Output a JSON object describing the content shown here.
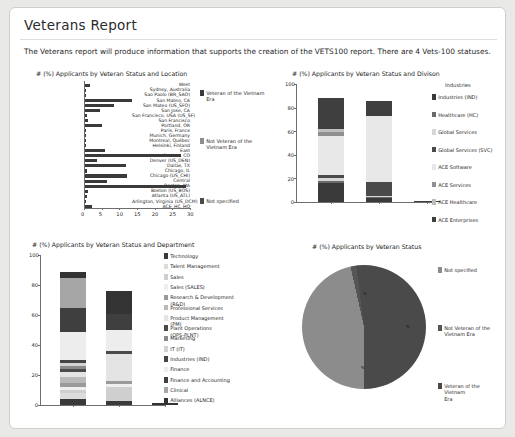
{
  "page": {
    "title": "Veterans Report",
    "intro": "The Veterans report will produce information that supports the creation of the VETS100 report. There are 4 Vets-100 statuses."
  },
  "colors": {
    "dark": "#3a3a3a",
    "mid": "#6f6f6f",
    "light": "#c9c9c9",
    "lighter": "#e2e2e2",
    "panel_bg": "#ffffff",
    "page_bg": "#e9e9e7",
    "border": "#d0cfcb"
  },
  "veteran_status_legend": [
    {
      "label": "Veteran of the Vietnam\nEra",
      "color": "#3a3a3a"
    },
    {
      "label": "Not Veteran of the\nVietnam Era",
      "color": "#8c8c8c"
    },
    {
      "label": "Not specified",
      "color": "#4a4a4a"
    }
  ],
  "chart_data": [
    {
      "id": "location-bar",
      "type": "bar",
      "orientation": "horizontal",
      "title": "# (%) Applicants by Veteran Status and Location",
      "xlabel": "",
      "ylabel": "",
      "xlim": [
        0,
        30
      ],
      "xticks": [
        0,
        5,
        10,
        15,
        20,
        25,
        30
      ],
      "categories": [
        "West",
        "Sydney, Australia",
        "Sao Paolo (BR_SAO)",
        "San Mateo, CA",
        "San Mateo (US_SFO)",
        "San Jose, CA",
        "San Francisco, USA (US_SF)",
        "San Francisco",
        "Portland, OR",
        "Paris, France",
        "Munich, Germany",
        "Montreal, Québec",
        "Helsinki, Finland",
        "East",
        "Denver, CO",
        "Denver (US_DEN)",
        "Dallas, TX",
        "Chicago, IL",
        "Chicago (US_CHI)",
        "Central",
        "Boston, MA",
        "Boston (US_BOS)",
        "Atlanta (US_ATL)",
        "Arlington, Virginia (US_DCM)",
        "ACE_HC_HQ"
      ],
      "values": [
        1.8,
        0.7,
        0.7,
        13.6,
        8.5,
        4.5,
        0.9,
        1.2,
        5.1,
        0.6,
        0.6,
        0.6,
        0.6,
        5.9,
        27.4,
        3.7,
        11.9,
        0.8,
        12.1,
        6.6,
        28.9,
        1.0,
        0.9,
        0.6,
        2.2
      ],
      "legend": [
        "Veteran of the Vietnam Era",
        "Not Veteran of the Vietnam Era",
        "Not specified"
      ],
      "legend_position": "right"
    },
    {
      "id": "division-stack",
      "type": "bar",
      "stacked": true,
      "title": "# (%) Applicants by Veteran Status and Divison",
      "ylim": [
        0,
        100
      ],
      "yticks": [
        0,
        20,
        40,
        60,
        80,
        100
      ],
      "categories": [
        "Veteran of the Vietnam Era",
        "Not Veteran of the Vietnam Era",
        "Not specified"
      ],
      "series": [
        {
          "name": "Industries (IND)",
          "color": "#3a3a3a",
          "values": [
            16.0,
            3.0,
            0.0
          ]
        },
        {
          "name": "Healthcare (HC)",
          "color": "#6a6a6a",
          "values": [
            2.0,
            1.5,
            0.0
          ]
        },
        {
          "name": "Global Services",
          "color": "#d6d6d6",
          "values": [
            2.0,
            0.5,
            0.0
          ]
        },
        {
          "name": "Global Services (SVC)",
          "color": "#4a4a4a",
          "values": [
            3.0,
            12.0,
            0.0
          ]
        },
        {
          "name": "ACE Software",
          "color": "#e8e8e8",
          "values": [
            33.0,
            56.0,
            0.0
          ]
        },
        {
          "name": "ACE Services",
          "color": "#8f8f8f",
          "values": [
            3.0,
            0.0,
            0.0
          ]
        },
        {
          "name": "ACE Healthcare",
          "color": "#bdbdbd",
          "values": [
            3.0,
            0.0,
            0.0
          ]
        },
        {
          "name": "ACE Enterprises",
          "color": "#3f3f3f",
          "values": [
            26.0,
            13.0,
            1.2
          ]
        }
      ],
      "legend_title": "Industries",
      "legend_position": "right"
    },
    {
      "id": "department-stack",
      "type": "bar",
      "stacked": true,
      "title": "# (%) Applicants by Veteran Status and Department",
      "ylim": [
        0,
        100
      ],
      "yticks": [
        0,
        20,
        40,
        60,
        80,
        100
      ],
      "categories": [
        "Veteran of the Vietnam Era",
        "Not Veteran of the Vietnam Era",
        "Not specified"
      ],
      "series": [
        {
          "name": "Technology",
          "color": "#3a3a3a",
          "values": [
            4.0,
            3.0,
            0.0
          ]
        },
        {
          "name": "Talent Management",
          "color": "#dcdcdc",
          "values": [
            4.0,
            0.0,
            0.0
          ]
        },
        {
          "name": "Sales",
          "color": "#cfcfcf",
          "values": [
            2.0,
            9.0,
            0.0
          ]
        },
        {
          "name": "Sales (SALES)",
          "color": "#efefef",
          "values": [
            2.0,
            2.0,
            0.0
          ]
        },
        {
          "name": "Research & Development\n(R&D)",
          "color": "#9a9a9a",
          "values": [
            3.0,
            2.0,
            0.0
          ]
        },
        {
          "name": "Professional Services",
          "color": "#b9b9b9",
          "values": [
            4.0,
            0.0,
            0.0
          ]
        },
        {
          "name": "Product Management\n(PM)",
          "color": "#e4e4e4",
          "values": [
            3.0,
            18.0,
            0.0
          ]
        },
        {
          "name": "Plant Operations\n(OPS-PLNT)",
          "color": "#4a4a4a",
          "values": [
            2.0,
            2.0,
            0.0
          ]
        },
        {
          "name": "Marketing",
          "color": "#8a8a8a",
          "values": [
            2.0,
            0.0,
            0.0
          ]
        },
        {
          "name": "IT (IT)",
          "color": "#d2d2d2",
          "values": [
            2.0,
            0.0,
            0.0
          ]
        },
        {
          "name": "Industries (IND)",
          "color": "#454545",
          "values": [
            2.0,
            0.0,
            0.0
          ]
        },
        {
          "name": "Finance",
          "color": "#ededed",
          "values": [
            19.0,
            14.0,
            0.0
          ]
        },
        {
          "name": "Finance and Accounting",
          "color": "#3f3f3f",
          "values": [
            16.0,
            11.0,
            0.0
          ]
        },
        {
          "name": "Clinical",
          "color": "#a6a6a6",
          "values": [
            20.0,
            0.0,
            0.0
          ]
        },
        {
          "name": "Alliances (ALNCE)",
          "color": "#333333",
          "values": [
            4.0,
            15.0,
            1.2
          ]
        }
      ],
      "legend_position": "right"
    },
    {
      "id": "status-pie",
      "type": "pie",
      "title": "# (%) Applicants by Veteran Status",
      "labels": [
        "Not specified",
        "Not Veteran of the Vietnam Era",
        "Veteran of the Vietnam Era"
      ],
      "values": [
        46.5,
        1.5,
        52.0
      ],
      "colors": [
        "#8c8c8c",
        "#555555",
        "#4a4a4a"
      ],
      "slice_labels": [
        "%",
        "%",
        "%"
      ],
      "legend_position": "right"
    }
  ]
}
